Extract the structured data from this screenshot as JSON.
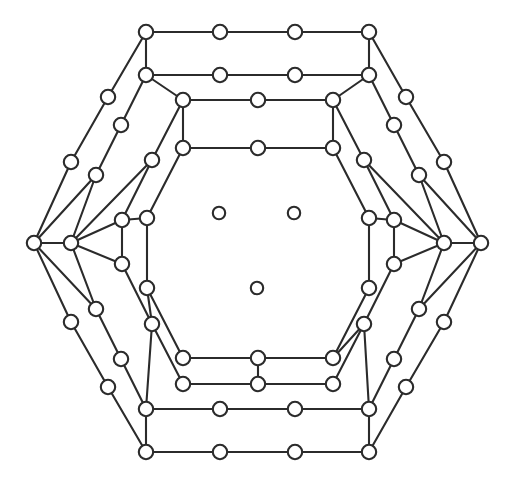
{
  "figure": {
    "kind": "node-link-diagram",
    "background_color": "#ffffff",
    "edge_color": "#2b2b2b",
    "node_fill_color": "#ffffff",
    "node_stroke_color": "#2b2b2b",
    "edge_stroke_width": 2.1,
    "node_radius": 7.2,
    "center_node_radius": 6.2,
    "canvas": {
      "width": 515,
      "height": 484
    }
  },
  "chart_data": {
    "type": "scatter",
    "xlabel": "",
    "ylabel": "",
    "grid": false,
    "legend": null,
    "xlim": [
      0,
      515
    ],
    "ylim": [
      0,
      484
    ],
    "symmetry": "6-fold dihedral (D6)",
    "node_count": 75,
    "edge_count": 84,
    "isolated_node_count": 3,
    "nodes": [
      {
        "id": "o0",
        "x": 146,
        "y": 32,
        "ring": "outer",
        "role": "corner"
      },
      {
        "id": "o1",
        "x": 220,
        "y": 32,
        "ring": "outer",
        "role": "subdivision"
      },
      {
        "id": "o2",
        "x": 295,
        "y": 32,
        "ring": "outer",
        "role": "subdivision"
      },
      {
        "id": "o3",
        "x": 369,
        "y": 32,
        "ring": "outer",
        "role": "corner"
      },
      {
        "id": "o4",
        "x": 406,
        "y": 97,
        "ring": "outer",
        "role": "subdivision"
      },
      {
        "id": "o5",
        "x": 444,
        "y": 162,
        "ring": "outer",
        "role": "subdivision"
      },
      {
        "id": "o6",
        "x": 481,
        "y": 243,
        "ring": "outer",
        "role": "corner"
      },
      {
        "id": "o7",
        "x": 444,
        "y": 322,
        "ring": "outer",
        "role": "subdivision"
      },
      {
        "id": "o8",
        "x": 406,
        "y": 387,
        "ring": "outer",
        "role": "subdivision"
      },
      {
        "id": "o9",
        "x": 369,
        "y": 452,
        "ring": "outer",
        "role": "corner"
      },
      {
        "id": "o10",
        "x": 295,
        "y": 452,
        "ring": "outer",
        "role": "subdivision"
      },
      {
        "id": "o11",
        "x": 220,
        "y": 452,
        "ring": "outer",
        "role": "subdivision"
      },
      {
        "id": "o12",
        "x": 146,
        "y": 452,
        "ring": "outer",
        "role": "corner"
      },
      {
        "id": "o13",
        "x": 108,
        "y": 387,
        "ring": "outer",
        "role": "subdivision"
      },
      {
        "id": "o14",
        "x": 71,
        "y": 322,
        "ring": "outer",
        "role": "subdivision"
      },
      {
        "id": "o15",
        "x": 34,
        "y": 243,
        "ring": "outer",
        "role": "corner"
      },
      {
        "id": "o16",
        "x": 71,
        "y": 162,
        "ring": "outer",
        "role": "subdivision"
      },
      {
        "id": "o17",
        "x": 108,
        "y": 97,
        "ring": "outer",
        "role": "subdivision"
      },
      {
        "id": "m0",
        "x": 146,
        "y": 75,
        "ring": "middle",
        "role": "corner"
      },
      {
        "id": "m1",
        "x": 220,
        "y": 75,
        "ring": "middle",
        "role": "subdivision"
      },
      {
        "id": "m2",
        "x": 295,
        "y": 75,
        "ring": "middle",
        "role": "subdivision"
      },
      {
        "id": "m3",
        "x": 369,
        "y": 75,
        "ring": "middle",
        "role": "corner"
      },
      {
        "id": "m4",
        "x": 394,
        "y": 125,
        "ring": "middle",
        "role": "subdivision"
      },
      {
        "id": "m5",
        "x": 419,
        "y": 175,
        "ring": "middle",
        "role": "subdivision"
      },
      {
        "id": "m6",
        "x": 444,
        "y": 243,
        "ring": "middle",
        "role": "corner"
      },
      {
        "id": "m7",
        "x": 419,
        "y": 309,
        "ring": "middle",
        "role": "subdivision"
      },
      {
        "id": "m8",
        "x": 394,
        "y": 359,
        "ring": "middle",
        "role": "subdivision"
      },
      {
        "id": "m9",
        "x": 369,
        "y": 409,
        "ring": "middle",
        "role": "corner"
      },
      {
        "id": "m10",
        "x": 295,
        "y": 409,
        "ring": "middle",
        "role": "subdivision"
      },
      {
        "id": "m11",
        "x": 220,
        "y": 409,
        "ring": "middle",
        "role": "subdivision"
      },
      {
        "id": "m12",
        "x": 146,
        "y": 409,
        "ring": "middle",
        "role": "corner"
      },
      {
        "id": "m13",
        "x": 121,
        "y": 359,
        "ring": "middle",
        "role": "subdivision"
      },
      {
        "id": "m14",
        "x": 96,
        "y": 309,
        "ring": "middle",
        "role": "subdivision"
      },
      {
        "id": "m15",
        "x": 71,
        "y": 243,
        "ring": "middle",
        "role": "corner"
      },
      {
        "id": "m16",
        "x": 96,
        "y": 175,
        "ring": "middle",
        "role": "subdivision"
      },
      {
        "id": "m17",
        "x": 121,
        "y": 125,
        "ring": "middle",
        "role": "subdivision"
      },
      {
        "id": "i0",
        "x": 183,
        "y": 100,
        "ring": "inner",
        "role": "corner"
      },
      {
        "id": "i1",
        "x": 258,
        "y": 100,
        "ring": "inner",
        "role": "subdivision"
      },
      {
        "id": "i2",
        "x": 333,
        "y": 100,
        "ring": "inner",
        "role": "corner"
      },
      {
        "id": "i3",
        "x": 364,
        "y": 160,
        "ring": "inner",
        "role": "subdivision"
      },
      {
        "id": "i4",
        "x": 394,
        "y": 220,
        "ring": "inner",
        "role": "corner"
      },
      {
        "id": "i5",
        "x": 394,
        "y": 264,
        "ring": "inner",
        "role": "subdivision"
      },
      {
        "id": "i6",
        "x": 364,
        "y": 324,
        "ring": "inner",
        "role": "corner"
      },
      {
        "id": "i7",
        "x": 333,
        "y": 384,
        "ring": "inner",
        "role": "subdivision"
      },
      {
        "id": "i8",
        "x": 258,
        "y": 384,
        "ring": "inner",
        "role": "corner"
      },
      {
        "id": "i9",
        "x": 183,
        "y": 384,
        "ring": "inner",
        "role": "subdivision"
      },
      {
        "id": "i10",
        "x": 152,
        "y": 324,
        "ring": "inner",
        "role": "corner"
      },
      {
        "id": "i11",
        "x": 122,
        "y": 264,
        "ring": "inner",
        "role": "subdivision"
      },
      {
        "id": "i12",
        "x": 122,
        "y": 220,
        "ring": "inner",
        "role": "corner"
      },
      {
        "id": "i13",
        "x": 152,
        "y": 160,
        "ring": "inner",
        "role": "subdivision"
      },
      {
        "id": "c0",
        "x": 183,
        "y": 148,
        "ring": "core",
        "role": "corner"
      },
      {
        "id": "c1",
        "x": 258,
        "y": 148,
        "ring": "core",
        "role": "subdivision"
      },
      {
        "id": "c2",
        "x": 333,
        "y": 148,
        "ring": "core",
        "role": "corner"
      },
      {
        "id": "c3",
        "x": 369,
        "y": 218,
        "ring": "core",
        "role": "subdivision"
      },
      {
        "id": "c4",
        "x": 369,
        "y": 288,
        "ring": "core",
        "role": "corner"
      },
      {
        "id": "c5",
        "x": 333,
        "y": 358,
        "ring": "core",
        "role": "subdivision"
      },
      {
        "id": "c6",
        "x": 258,
        "y": 358,
        "ring": "core",
        "role": "corner"
      },
      {
        "id": "c7",
        "x": 183,
        "y": 358,
        "ring": "core",
        "role": "subdivision"
      },
      {
        "id": "c8",
        "x": 147,
        "y": 288,
        "ring": "core",
        "role": "corner"
      },
      {
        "id": "c9",
        "x": 147,
        "y": 218,
        "ring": "core",
        "role": "subdivision"
      },
      {
        "id": "z0",
        "x": 219,
        "y": 213,
        "ring": "center",
        "role": "isolated"
      },
      {
        "id": "z1",
        "x": 294,
        "y": 213,
        "ring": "center",
        "role": "isolated"
      },
      {
        "id": "z2",
        "x": 257,
        "y": 288,
        "ring": "center",
        "role": "isolated"
      }
    ],
    "edges": [
      [
        "o0",
        "o1"
      ],
      [
        "o1",
        "o2"
      ],
      [
        "o2",
        "o3"
      ],
      [
        "o3",
        "o4"
      ],
      [
        "o4",
        "o5"
      ],
      [
        "o5",
        "o6"
      ],
      [
        "o6",
        "o7"
      ],
      [
        "o7",
        "o8"
      ],
      [
        "o8",
        "o9"
      ],
      [
        "o9",
        "o10"
      ],
      [
        "o10",
        "o11"
      ],
      [
        "o11",
        "o12"
      ],
      [
        "o12",
        "o13"
      ],
      [
        "o13",
        "o14"
      ],
      [
        "o14",
        "o15"
      ],
      [
        "o15",
        "o16"
      ],
      [
        "o16",
        "o17"
      ],
      [
        "o17",
        "o0"
      ],
      [
        "m0",
        "m1"
      ],
      [
        "m1",
        "m2"
      ],
      [
        "m2",
        "m3"
      ],
      [
        "m3",
        "m4"
      ],
      [
        "m4",
        "m5"
      ],
      [
        "m5",
        "m6"
      ],
      [
        "m6",
        "m7"
      ],
      [
        "m7",
        "m8"
      ],
      [
        "m8",
        "m9"
      ],
      [
        "m9",
        "m10"
      ],
      [
        "m10",
        "m11"
      ],
      [
        "m11",
        "m12"
      ],
      [
        "m12",
        "m13"
      ],
      [
        "m13",
        "m14"
      ],
      [
        "m14",
        "m15"
      ],
      [
        "m15",
        "m16"
      ],
      [
        "m16",
        "m17"
      ],
      [
        "m17",
        "m0"
      ],
      [
        "i0",
        "i1"
      ],
      [
        "i1",
        "i2"
      ],
      [
        "i2",
        "i3"
      ],
      [
        "i3",
        "i4"
      ],
      [
        "i4",
        "i5"
      ],
      [
        "i5",
        "i6"
      ],
      [
        "i6",
        "i7"
      ],
      [
        "i7",
        "i8"
      ],
      [
        "i8",
        "i9"
      ],
      [
        "i9",
        "i10"
      ],
      [
        "i10",
        "i11"
      ],
      [
        "i11",
        "i12"
      ],
      [
        "i12",
        "i13"
      ],
      [
        "i13",
        "i0"
      ],
      [
        "c0",
        "c1"
      ],
      [
        "c1",
        "c2"
      ],
      [
        "c2",
        "c3"
      ],
      [
        "c3",
        "c4"
      ],
      [
        "c4",
        "c5"
      ],
      [
        "c5",
        "c6"
      ],
      [
        "c6",
        "c7"
      ],
      [
        "c7",
        "c8"
      ],
      [
        "c8",
        "c9"
      ],
      [
        "c9",
        "c0"
      ],
      [
        "o0",
        "m0"
      ],
      [
        "o3",
        "m3"
      ],
      [
        "o6",
        "m6"
      ],
      [
        "o9",
        "m9"
      ],
      [
        "o12",
        "m12"
      ],
      [
        "o15",
        "m15"
      ],
      [
        "m0",
        "i0"
      ],
      [
        "m3",
        "i2"
      ],
      [
        "m6",
        "i4"
      ],
      [
        "m9",
        "i6"
      ],
      [
        "m12",
        "i10"
      ],
      [
        "m15",
        "i12"
      ],
      [
        "i0",
        "c0"
      ],
      [
        "i2",
        "c2"
      ],
      [
        "i4",
        "c3"
      ],
      [
        "i6",
        "c5"
      ],
      [
        "i8",
        "c6"
      ],
      [
        "i10",
        "c8"
      ],
      [
        "i12",
        "c9"
      ],
      [
        "o15",
        "m16"
      ],
      [
        "o15",
        "m14"
      ],
      [
        "o6",
        "m5"
      ],
      [
        "o6",
        "m7"
      ],
      [
        "m15",
        "i13"
      ],
      [
        "m15",
        "i11"
      ],
      [
        "m6",
        "i3"
      ],
      [
        "m6",
        "i5"
      ],
      [
        "i12",
        "c9"
      ],
      [
        "i4",
        "c3"
      ]
    ]
  }
}
